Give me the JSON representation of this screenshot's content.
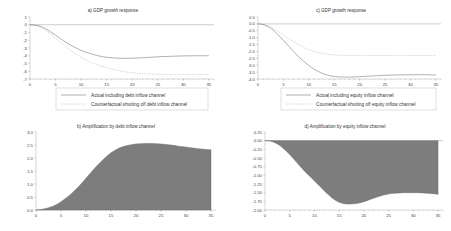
{
  "figure": {
    "background": "#ffffff",
    "panel_count": 4,
    "line_color": "#6f6f6f",
    "dash_color": "#a8a8a8",
    "fill_color": "#7d7d7d"
  },
  "chart_data": [
    {
      "id": "panel-a",
      "type": "line",
      "title": "a) GDP growth response",
      "xlabel": "",
      "ylabel": "",
      "xlim": [
        0,
        36
      ],
      "ylim": [
        -7,
        1
      ],
      "xticks": [
        0,
        5,
        10,
        15,
        20,
        25,
        30,
        35
      ],
      "yticks": [
        1,
        0,
        -1,
        -2,
        -3,
        -4,
        -5,
        -6,
        -7
      ],
      "grid": false,
      "legend_position": "bottom",
      "x": [
        0,
        1,
        2,
        3,
        4,
        5,
        6,
        7,
        8,
        9,
        10,
        11,
        12,
        13,
        14,
        15,
        16,
        17,
        18,
        19,
        20,
        21,
        22,
        23,
        24,
        25,
        26,
        27,
        28,
        29,
        30,
        31,
        32,
        33,
        34,
        35
      ],
      "series": [
        {
          "name": "Actual including debt inflow channel",
          "style": "solid",
          "values": [
            0.0,
            -0.05,
            -0.2,
            -0.5,
            -0.9,
            -1.35,
            -1.8,
            -2.25,
            -2.65,
            -3.0,
            -3.3,
            -3.55,
            -3.75,
            -3.95,
            -4.1,
            -4.2,
            -4.27,
            -4.31,
            -4.33,
            -4.33,
            -4.31,
            -4.29,
            -4.26,
            -4.22,
            -4.18,
            -4.14,
            -4.11,
            -4.08,
            -4.06,
            -4.04,
            -4.02,
            -4.01,
            -4.0,
            -4.0,
            -4.0,
            -4.0
          ]
        },
        {
          "name": "Counterfactual shutting off debt inflow channel",
          "style": "dashed",
          "values": [
            0.0,
            -0.07,
            -0.3,
            -0.7,
            -1.2,
            -1.75,
            -2.3,
            -2.85,
            -3.35,
            -3.8,
            -4.2,
            -4.55,
            -4.85,
            -5.12,
            -5.35,
            -5.55,
            -5.72,
            -5.87,
            -6.0,
            -6.1,
            -6.18,
            -6.25,
            -6.3,
            -6.34,
            -6.37,
            -6.39,
            -6.4,
            -6.41,
            -6.41,
            -6.41,
            -6.41,
            -6.4,
            -6.4,
            -6.4,
            -6.4,
            -6.4
          ]
        }
      ]
    },
    {
      "id": "panel-c",
      "type": "line",
      "title": "c) GDP growth response",
      "xlabel": "",
      "ylabel": "",
      "xlim": [
        0,
        36
      ],
      "ylim": [
        -4.0,
        0.5
      ],
      "xticks": [
        0,
        5,
        10,
        15,
        20,
        25,
        30,
        35
      ],
      "yticks": [
        0.5,
        0.0,
        -0.5,
        -1.0,
        -1.5,
        -2.0,
        -2.5,
        -3.0,
        -3.5,
        -4.0
      ],
      "grid": false,
      "legend_position": "bottom",
      "x": [
        0,
        1,
        2,
        3,
        4,
        5,
        6,
        7,
        8,
        9,
        10,
        11,
        12,
        13,
        14,
        15,
        16,
        17,
        18,
        19,
        20,
        21,
        22,
        23,
        24,
        25,
        26,
        27,
        28,
        29,
        30,
        31,
        32,
        33,
        34,
        35
      ],
      "series": [
        {
          "name": "Actual including equity inflow channel",
          "style": "solid",
          "values": [
            0.0,
            -0.05,
            -0.2,
            -0.45,
            -0.8,
            -1.2,
            -1.6,
            -2.0,
            -2.38,
            -2.72,
            -3.02,
            -3.28,
            -3.48,
            -3.64,
            -3.75,
            -3.82,
            -3.85,
            -3.86,
            -3.86,
            -3.85,
            -3.83,
            -3.81,
            -3.79,
            -3.77,
            -3.75,
            -3.73,
            -3.72,
            -3.71,
            -3.7,
            -3.7,
            -3.69,
            -3.69,
            -3.69,
            -3.69,
            -3.7,
            -3.7
          ]
        },
        {
          "name": "Counterfactual shutting off equity inflow channel",
          "style": "dashed",
          "values": [
            0.0,
            -0.04,
            -0.14,
            -0.32,
            -0.55,
            -0.8,
            -1.05,
            -1.3,
            -1.52,
            -1.72,
            -1.88,
            -2.0,
            -2.1,
            -2.17,
            -2.22,
            -2.25,
            -2.27,
            -2.28,
            -2.29,
            -2.29,
            -2.3,
            -2.3,
            -2.3,
            -2.3,
            -2.3,
            -2.3,
            -2.3,
            -2.3,
            -2.3,
            -2.3,
            -2.3,
            -2.3,
            -2.3,
            -2.3,
            -2.3,
            -2.3
          ]
        }
      ]
    },
    {
      "id": "panel-b",
      "type": "area",
      "title": "b) Amplification by debt inflow channel",
      "xlabel": "",
      "ylabel": "",
      "xlim": [
        0,
        36
      ],
      "ylim": [
        0.0,
        3.0
      ],
      "xticks": [
        0,
        5,
        10,
        15,
        20,
        25,
        30,
        35
      ],
      "yticks": [
        0.0,
        0.5,
        1.0,
        1.5,
        2.0,
        2.5,
        3.0
      ],
      "grid": false,
      "legend_position": "none",
      "x": [
        0,
        1,
        2,
        3,
        4,
        5,
        6,
        7,
        8,
        9,
        10,
        11,
        12,
        13,
        14,
        15,
        16,
        17,
        18,
        19,
        20,
        21,
        22,
        23,
        24,
        25,
        26,
        27,
        28,
        29,
        30,
        31,
        32,
        33,
        34,
        35
      ],
      "series": [
        {
          "name": "Amplification by debt inflow channel",
          "style": "filled",
          "values": [
            0.0,
            0.02,
            0.06,
            0.12,
            0.2,
            0.32,
            0.46,
            0.62,
            0.8,
            1.0,
            1.22,
            1.44,
            1.66,
            1.86,
            2.04,
            2.2,
            2.32,
            2.41,
            2.47,
            2.51,
            2.54,
            2.55,
            2.56,
            2.56,
            2.55,
            2.54,
            2.52,
            2.5,
            2.47,
            2.44,
            2.42,
            2.39,
            2.37,
            2.35,
            2.33,
            2.32
          ]
        }
      ]
    },
    {
      "id": "panel-d",
      "type": "area",
      "title": "d) Amplification by equity inflow channel",
      "xlabel": "",
      "ylabel": "",
      "xlim": [
        0,
        36
      ],
      "ylim": [
        -2.0,
        0.25
      ],
      "xticks": [
        0,
        5,
        10,
        15,
        20,
        25,
        30,
        35
      ],
      "yticks": [
        0.25,
        0.0,
        -0.25,
        -0.5,
        -0.75,
        -1.0,
        -1.25,
        -1.5,
        -1.75,
        -2.0
      ],
      "grid": false,
      "legend_position": "none",
      "x": [
        0,
        1,
        2,
        3,
        4,
        5,
        6,
        7,
        8,
        9,
        10,
        11,
        12,
        13,
        14,
        15,
        16,
        17,
        18,
        19,
        20,
        21,
        22,
        23,
        24,
        25,
        26,
        27,
        28,
        29,
        30,
        31,
        32,
        33,
        34,
        35
      ],
      "series": [
        {
          "name": "Amplification by equity inflow channel",
          "style": "filled",
          "values": [
            0.0,
            -0.01,
            -0.06,
            -0.14,
            -0.26,
            -0.4,
            -0.56,
            -0.72,
            -0.88,
            -1.02,
            -1.16,
            -1.3,
            -1.45,
            -1.58,
            -1.7,
            -1.78,
            -1.82,
            -1.83,
            -1.82,
            -1.8,
            -1.76,
            -1.71,
            -1.66,
            -1.61,
            -1.57,
            -1.54,
            -1.52,
            -1.51,
            -1.5,
            -1.5,
            -1.5,
            -1.5,
            -1.51,
            -1.52,
            -1.53,
            -1.55
          ]
        }
      ]
    }
  ]
}
